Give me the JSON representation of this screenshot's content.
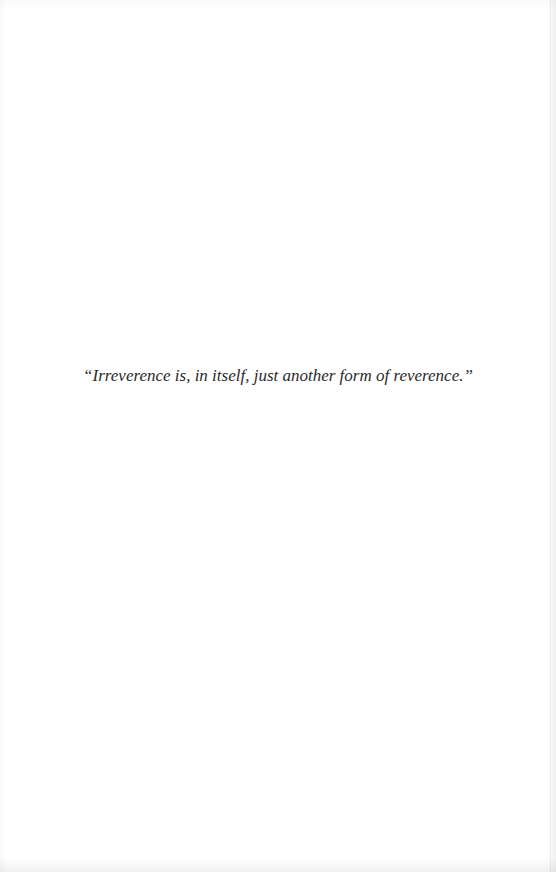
{
  "page": {
    "background_color": "#ffffff",
    "text_color": "#2a2a2a"
  },
  "epigraph": {
    "quote": "“Irreverence is, in itself, just another form of reverence.”"
  }
}
